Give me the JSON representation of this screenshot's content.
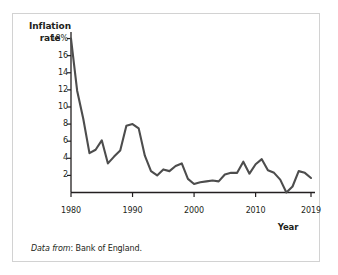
{
  "figure": {
    "y_axis_title_line1": "Inflation",
    "y_axis_title_line2": "rate",
    "x_axis_title": "Year",
    "source_lead": "Data from",
    "source_rest": ": Bank of England."
  },
  "chart_data": {
    "type": "line",
    "title": "",
    "xlabel": "Year",
    "ylabel": "Inflation rate",
    "ylim": [
      0,
      19
    ],
    "xlim": [
      1980,
      2019
    ],
    "grid": false,
    "legend": null,
    "y_tick_labels": [
      "18%",
      "16",
      "14",
      "12",
      "10",
      "8",
      "6",
      "4",
      "2"
    ],
    "y_ticks": [
      18,
      16,
      14,
      12,
      10,
      8,
      6,
      4,
      2
    ],
    "x_tick_labels": [
      "1980",
      "1990",
      "2000",
      "2010",
      "2019"
    ],
    "x_ticks": [
      1980,
      1990,
      2000,
      2010,
      2019
    ],
    "line_color": "#4d4d4d",
    "axis_color": "#231f20",
    "series": [
      {
        "name": "UK inflation rate",
        "x": [
          1980,
          1981,
          1982,
          1983,
          1984,
          1985,
          1986,
          1987,
          1988,
          1989,
          1990,
          1991,
          1992,
          1993,
          1994,
          1995,
          1996,
          1997,
          1998,
          1999,
          2000,
          2001,
          2002,
          2003,
          2004,
          2005,
          2006,
          2007,
          2008,
          2009,
          2010,
          2011,
          2012,
          2013,
          2014,
          2015,
          2016,
          2017,
          2018,
          2019
        ],
        "values": [
          18.0,
          11.9,
          8.6,
          4.6,
          5.0,
          6.1,
          3.4,
          4.2,
          4.9,
          7.8,
          8.0,
          7.5,
          4.3,
          2.5,
          2.0,
          2.7,
          2.5,
          3.1,
          3.4,
          1.6,
          1.0,
          1.2,
          1.3,
          1.4,
          1.3,
          2.1,
          2.3,
          2.3,
          3.6,
          2.2,
          3.3,
          3.9,
          2.6,
          2.3,
          1.5,
          0.0,
          0.7,
          2.5,
          2.3,
          1.7
        ]
      }
    ]
  }
}
